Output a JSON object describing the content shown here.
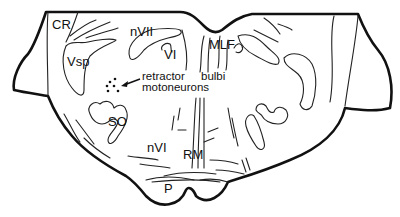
{
  "diagram": {
    "type": "anatomical-cross-section",
    "labels": {
      "cr": "CR",
      "vsp": "Vsp",
      "nvii": "nVII",
      "vi": "VI",
      "mlf": "MLF",
      "retractor_line1": "retractor",
      "retractor_line2": "motoneurons",
      "bulbi": "bulbi",
      "so": "SO",
      "nvi": "nVI",
      "rm": "RM",
      "p": "P"
    },
    "colors": {
      "line": "#111111",
      "background": "#ffffff"
    }
  }
}
